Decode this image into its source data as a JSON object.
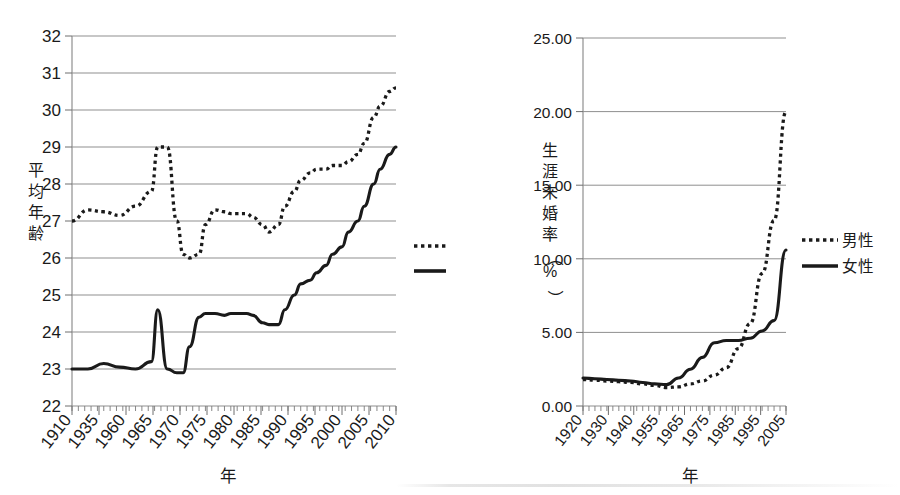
{
  "charts": [
    {
      "id": "marriage-age",
      "ylabel": "平均年齢",
      "xlabel": "年",
      "ylim": [
        22,
        32
      ],
      "yticks": [
        "22",
        "23",
        "24",
        "25",
        "26",
        "27",
        "28",
        "29",
        "30",
        "31",
        "32"
      ],
      "xticks": [
        "1910",
        "1935",
        "1960",
        "1965",
        "1970",
        "1975",
        "1980",
        "1985",
        "1990",
        "1995",
        "2000",
        "2005",
        "2010"
      ],
      "legend": [
        {
          "label": "夫",
          "style": "dotted"
        },
        {
          "label": "妻",
          "style": "solid"
        }
      ]
    },
    {
      "id": "lifetime-unmarried-rate",
      "ylabel": "生涯未婚率（%）",
      "xlabel": "年",
      "ylim": [
        0,
        25
      ],
      "yticks": [
        "0.00",
        "5.00",
        "10.00",
        "15.00",
        "20.00",
        "25.00"
      ],
      "xticks": [
        "1920",
        "1930",
        "1940",
        "1955",
        "1965",
        "1975",
        "1985",
        "1995",
        "2005"
      ],
      "legend": [
        {
          "label": "男性",
          "style": "dotted"
        },
        {
          "label": "女性",
          "style": "solid"
        }
      ]
    }
  ],
  "chart_data": [
    {
      "type": "line",
      "title": "",
      "xlabel": "年",
      "ylabel": "平均年齢",
      "ylim": [
        22,
        32
      ],
      "xlim": [
        1910,
        2012
      ],
      "grid": true,
      "legend_position": "right",
      "xtick_labels": [
        "1910",
        "1935",
        "1960",
        "1965",
        "1970",
        "1975",
        "1980",
        "1985",
        "1990",
        "1995",
        "2000",
        "2005",
        "2010"
      ],
      "ytick_labels": [
        "22",
        "23",
        "24",
        "25",
        "26",
        "27",
        "28",
        "29",
        "30",
        "31",
        "32"
      ],
      "series": [
        {
          "name": "夫",
          "style": "dotted",
          "x": [
            1910,
            1915,
            1920,
            1925,
            1930,
            1935,
            1937,
            1940,
            1943,
            1945,
            1947,
            1950,
            1952,
            1955,
            1958,
            1960,
            1962,
            1965,
            1967,
            1970,
            1972,
            1975,
            1977,
            1980,
            1982,
            1985,
            1987,
            1990,
            1992,
            1995,
            1997,
            2000,
            2002,
            2005,
            2007,
            2010,
            2012
          ],
          "y": [
            27.0,
            27.3,
            27.25,
            27.15,
            27.4,
            27.8,
            29.0,
            29.0,
            27.0,
            26.1,
            26.0,
            26.1,
            26.9,
            27.3,
            27.25,
            27.2,
            27.2,
            27.2,
            27.1,
            26.9,
            26.7,
            26.9,
            27.4,
            27.8,
            28.1,
            28.3,
            28.4,
            28.4,
            28.5,
            28.5,
            28.6,
            28.8,
            29.1,
            29.8,
            30.1,
            30.5,
            30.6
          ]
        },
        {
          "name": "妻",
          "style": "solid",
          "x": [
            1910,
            1915,
            1920,
            1925,
            1930,
            1935,
            1937,
            1940,
            1943,
            1945,
            1947,
            1950,
            1952,
            1955,
            1958,
            1960,
            1962,
            1965,
            1967,
            1970,
            1972,
            1975,
            1977,
            1980,
            1982,
            1985,
            1987,
            1990,
            1992,
            1995,
            1997,
            2000,
            2002,
            2005,
            2007,
            2010,
            2012
          ],
          "y": [
            23.0,
            23.0,
            23.15,
            23.05,
            23.0,
            23.2,
            24.6,
            23.0,
            22.9,
            22.9,
            23.6,
            24.4,
            24.5,
            24.5,
            24.45,
            24.5,
            24.5,
            24.5,
            24.45,
            24.25,
            24.2,
            24.2,
            24.6,
            25.0,
            25.3,
            25.4,
            25.6,
            25.8,
            26.1,
            26.3,
            26.7,
            27.0,
            27.4,
            28.0,
            28.4,
            28.8,
            29.0
          ]
        }
      ]
    },
    {
      "type": "line",
      "title": "",
      "xlabel": "年",
      "ylabel": "生涯未婚率（%）",
      "ylim": [
        0,
        25
      ],
      "xlim": [
        1920,
        2005
      ],
      "grid": true,
      "legend_position": "right",
      "xtick_labels": [
        "1920",
        "1930",
        "1940",
        "1955",
        "1965",
        "1975",
        "1985",
        "1995",
        "2005"
      ],
      "ytick_labels": [
        "0.00",
        "5.00",
        "10.00",
        "15.00",
        "20.00",
        "25.00"
      ],
      "series": [
        {
          "name": "男性",
          "style": "dotted",
          "x": [
            1920,
            1925,
            1930,
            1935,
            1940,
            1945,
            1950,
            1955,
            1960,
            1965,
            1970,
            1975,
            1980,
            1985,
            1990,
            1995,
            2000,
            2005
          ],
          "y": [
            1.8,
            1.75,
            1.7,
            1.65,
            1.6,
            1.5,
            1.4,
            1.25,
            1.3,
            1.5,
            1.7,
            2.1,
            2.6,
            3.9,
            5.6,
            9.0,
            12.6,
            20.0
          ]
        },
        {
          "name": "女性",
          "style": "solid",
          "x": [
            1920,
            1925,
            1930,
            1935,
            1940,
            1945,
            1950,
            1955,
            1960,
            1965,
            1970,
            1975,
            1980,
            1985,
            1990,
            1995,
            2000,
            2005
          ],
          "y": [
            1.9,
            1.85,
            1.8,
            1.75,
            1.7,
            1.6,
            1.5,
            1.45,
            1.9,
            2.5,
            3.3,
            4.3,
            4.45,
            4.45,
            4.6,
            5.1,
            5.8,
            10.6
          ]
        }
      ]
    }
  ],
  "colors": {
    "ink": "#1a1a1a",
    "grid": "#8f8f8f",
    "background": "#ffffff"
  }
}
